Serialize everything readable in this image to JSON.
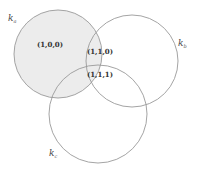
{
  "diagram": {
    "type": "venn",
    "colors": {
      "shade": "#ececec",
      "outline": "#9a9a9a",
      "text": "#333333",
      "background": "#ffffff"
    },
    "sets": [
      {
        "id": "a",
        "label": "k",
        "subscript": "a",
        "cx": 58,
        "cy": 54,
        "r": 44,
        "label_x": 8,
        "label_y": 21
      },
      {
        "id": "b",
        "label": "k",
        "subscript": "b",
        "cx": 132,
        "cy": 61,
        "r": 46,
        "label_x": 178,
        "label_y": 46
      },
      {
        "id": "c",
        "label": "k",
        "subscript": "c",
        "cx": 98,
        "cy": 114,
        "r": 49,
        "label_x": 49,
        "label_y": 156
      }
    ],
    "regions": [
      {
        "label": "(1,0,0)",
        "x": 50,
        "y": 47,
        "shaded": true
      },
      {
        "label": "(1,1,0)",
        "x": 100,
        "y": 54,
        "shaded": true
      },
      {
        "label": "(1,1,1)",
        "x": 100,
        "y": 77,
        "shaded": true
      }
    ],
    "shaded_set": "a"
  }
}
